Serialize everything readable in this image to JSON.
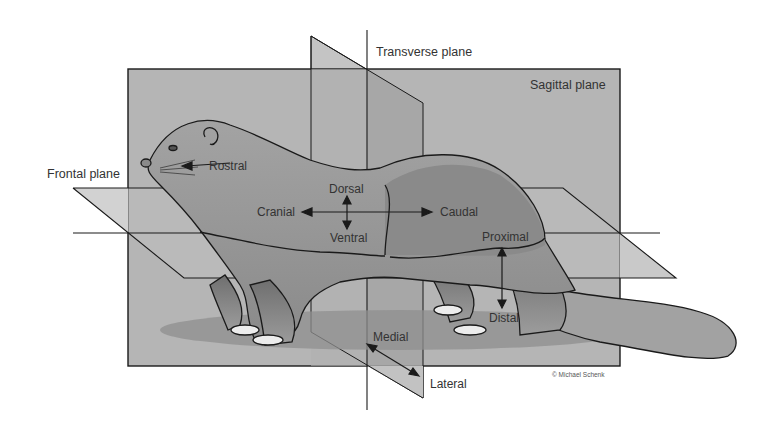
{
  "diagram": {
    "type": "anatomical-planes-and-directional-terms",
    "planes": {
      "transverse": "Transverse plane",
      "sagittal": "Sagittal plane",
      "frontal": "Frontal plane"
    },
    "directions": {
      "rostral": "Rostral",
      "dorsal": "Dorsal",
      "ventral": "Ventral",
      "cranial": "Cranial",
      "caudal": "Caudal",
      "proximal": "Proximal",
      "distal": "Distal",
      "medial": "Medial",
      "lateral": "Lateral"
    },
    "credit": "© Michael Schenk",
    "colors": {
      "background": "#ffffff",
      "sagittal_fill": "#b5b5b5",
      "transverse_fill": "#a6a6a6",
      "frontal_fill": "#c9c9c9",
      "body_fill": "#9a9a9a",
      "body_dark": "#7e7e7e",
      "shadow": "#8c8c8c",
      "line": "#1a1a1a",
      "text": "#333333"
    }
  }
}
